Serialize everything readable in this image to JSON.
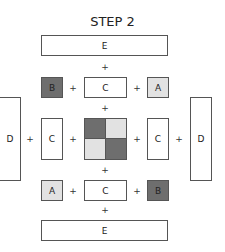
{
  "title": "STEP 2",
  "colors": {
    "dark": "#6e6e6e",
    "light": "#e2e2e2",
    "white": "#ffffff",
    "border": "#555555"
  },
  "plus": "+",
  "top": {
    "e": "E",
    "row": {
      "left": "B",
      "middle": "C",
      "right": "A"
    }
  },
  "middle": {
    "d_left": "D",
    "c_left": "C",
    "grid": [
      "dark",
      "light",
      "light",
      "dark"
    ],
    "c_right": "C",
    "d_right": "D"
  },
  "bottom": {
    "row": {
      "left": "A",
      "middle": "C",
      "right": "B"
    },
    "e": "E"
  }
}
